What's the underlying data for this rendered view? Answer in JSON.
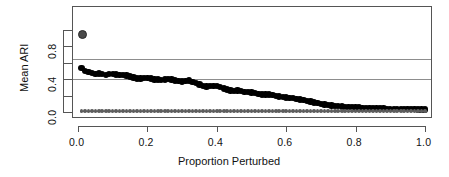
{
  "chart_data": {
    "type": "scatter",
    "title": "",
    "xlabel": "Proportion Perturbed",
    "ylabel": "Mean ARI",
    "xlim": [
      0.0,
      1.0
    ],
    "ylim": [
      0.0,
      1.0
    ],
    "grid": false,
    "legend": "none",
    "x_ticks": [
      {
        "value": 0.0,
        "label": "0.0"
      },
      {
        "value": 0.2,
        "label": "0.2"
      },
      {
        "value": 0.4,
        "label": "0.4"
      },
      {
        "value": 0.6,
        "label": "0.6"
      },
      {
        "value": 0.8,
        "label": "0.8"
      },
      {
        "value": 1.0,
        "label": "1.0"
      }
    ],
    "y_ticks": [
      {
        "value": 0.0,
        "label": "0.0"
      },
      {
        "value": 0.2,
        "label": ""
      },
      {
        "value": 0.4,
        "label": "0.4"
      },
      {
        "value": 0.6,
        "label": ""
      },
      {
        "value": 0.8,
        "label": "0.8"
      },
      {
        "value": 1.0,
        "label": ""
      }
    ],
    "reference_lines": [
      {
        "name": "upper-reference-line",
        "y": 0.645,
        "color": "#8d8d8d"
      },
      {
        "name": "lower-reference-line",
        "y": 0.395,
        "color": "#8d8d8d"
      }
    ],
    "series": [
      {
        "name": "outlier-point",
        "marker": "circle-open",
        "color": "#4a4a4a",
        "size": 4.5,
        "x": [
          0.012
        ],
        "values": [
          0.935
        ]
      },
      {
        "name": "mean-ari-series",
        "marker": "filled-circle",
        "color": "#000000",
        "size": 3.2,
        "x": [
          0.01,
          0.02,
          0.03,
          0.04,
          0.05,
          0.06,
          0.07,
          0.08,
          0.09,
          0.1,
          0.11,
          0.12,
          0.13,
          0.14,
          0.15,
          0.16,
          0.17,
          0.18,
          0.19,
          0.2,
          0.21,
          0.22,
          0.23,
          0.24,
          0.25,
          0.26,
          0.27,
          0.28,
          0.29,
          0.3,
          0.31,
          0.32,
          0.33,
          0.34,
          0.35,
          0.36,
          0.37,
          0.38,
          0.39,
          0.4,
          0.41,
          0.42,
          0.43,
          0.44,
          0.45,
          0.46,
          0.47,
          0.48,
          0.49,
          0.5,
          0.51,
          0.52,
          0.53,
          0.54,
          0.55,
          0.56,
          0.57,
          0.58,
          0.59,
          0.6,
          0.61,
          0.62,
          0.63,
          0.64,
          0.65,
          0.66,
          0.67,
          0.68,
          0.69,
          0.7,
          0.71,
          0.72,
          0.73,
          0.74,
          0.75,
          0.76,
          0.77,
          0.78,
          0.79,
          0.8,
          0.81,
          0.82,
          0.83,
          0.84,
          0.85,
          0.86,
          0.87,
          0.88,
          0.89,
          0.9,
          0.91,
          0.92,
          0.93,
          0.94,
          0.95,
          0.96,
          0.97,
          0.98,
          0.99,
          1.0
        ],
        "values": [
          0.53,
          0.5,
          0.483,
          0.47,
          0.462,
          0.468,
          0.462,
          0.452,
          0.458,
          0.462,
          0.455,
          0.448,
          0.452,
          0.444,
          0.43,
          0.418,
          0.408,
          0.406,
          0.412,
          0.414,
          0.406,
          0.396,
          0.392,
          0.386,
          0.392,
          0.398,
          0.394,
          0.38,
          0.376,
          0.37,
          0.378,
          0.382,
          0.364,
          0.348,
          0.332,
          0.318,
          0.31,
          0.316,
          0.312,
          0.318,
          0.3,
          0.286,
          0.272,
          0.262,
          0.258,
          0.262,
          0.254,
          0.246,
          0.24,
          0.236,
          0.228,
          0.218,
          0.21,
          0.212,
          0.214,
          0.206,
          0.196,
          0.186,
          0.18,
          0.178,
          0.172,
          0.168,
          0.158,
          0.15,
          0.142,
          0.134,
          0.126,
          0.116,
          0.106,
          0.098,
          0.092,
          0.086,
          0.08,
          0.076,
          0.072,
          0.068,
          0.064,
          0.062,
          0.058,
          0.056,
          0.054,
          0.05,
          0.048,
          0.046,
          0.046,
          0.044,
          0.042,
          0.042,
          0.04,
          0.04,
          0.038,
          0.038,
          0.036,
          0.036,
          0.034,
          0.034,
          0.033,
          0.032,
          0.032,
          0.031
        ]
      },
      {
        "name": "baseline-series",
        "marker": "small-filled-circle",
        "color": "#5d5d5d",
        "size": 1.8,
        "x": [
          0.01,
          0.02,
          0.03,
          0.04,
          0.05,
          0.06,
          0.07,
          0.08,
          0.09,
          0.1,
          0.11,
          0.12,
          0.13,
          0.14,
          0.15,
          0.16,
          0.17,
          0.18,
          0.19,
          0.2,
          0.21,
          0.22,
          0.23,
          0.24,
          0.25,
          0.26,
          0.27,
          0.28,
          0.29,
          0.3,
          0.31,
          0.32,
          0.33,
          0.34,
          0.35,
          0.36,
          0.37,
          0.38,
          0.39,
          0.4,
          0.41,
          0.42,
          0.43,
          0.44,
          0.45,
          0.46,
          0.47,
          0.48,
          0.49,
          0.5,
          0.51,
          0.52,
          0.53,
          0.54,
          0.55,
          0.56,
          0.57,
          0.58,
          0.59,
          0.6,
          0.61,
          0.62,
          0.63,
          0.64,
          0.65,
          0.66,
          0.67,
          0.68,
          0.69,
          0.7,
          0.71,
          0.72,
          0.73,
          0.74,
          0.75,
          0.76,
          0.77,
          0.78,
          0.79,
          0.8,
          0.81,
          0.82,
          0.83,
          0.84,
          0.85,
          0.86,
          0.87,
          0.88,
          0.89,
          0.9,
          0.91,
          0.92,
          0.93,
          0.94,
          0.95,
          0.96,
          0.97,
          0.98,
          0.99,
          1.0
        ],
        "values": [
          0.012,
          0.012,
          0.012,
          0.012,
          0.012,
          0.012,
          0.012,
          0.012,
          0.012,
          0.012,
          0.012,
          0.012,
          0.012,
          0.012,
          0.012,
          0.012,
          0.012,
          0.012,
          0.012,
          0.012,
          0.012,
          0.012,
          0.012,
          0.012,
          0.012,
          0.012,
          0.012,
          0.012,
          0.012,
          0.012,
          0.012,
          0.012,
          0.012,
          0.012,
          0.012,
          0.012,
          0.012,
          0.012,
          0.012,
          0.012,
          0.012,
          0.012,
          0.012,
          0.012,
          0.012,
          0.012,
          0.012,
          0.012,
          0.012,
          0.012,
          0.012,
          0.012,
          0.012,
          0.012,
          0.012,
          0.012,
          0.012,
          0.012,
          0.012,
          0.012,
          0.012,
          0.012,
          0.012,
          0.012,
          0.012,
          0.012,
          0.012,
          0.012,
          0.012,
          0.012,
          0.012,
          0.012,
          0.012,
          0.012,
          0.012,
          0.012,
          0.012,
          0.012,
          0.012,
          0.012,
          0.012,
          0.012,
          0.012,
          0.012,
          0.012,
          0.012,
          0.012,
          0.012,
          0.012,
          0.012,
          0.012,
          0.012,
          0.012,
          0.012,
          0.012,
          0.012,
          0.012,
          0.012,
          0.012,
          0.012
        ]
      }
    ]
  }
}
